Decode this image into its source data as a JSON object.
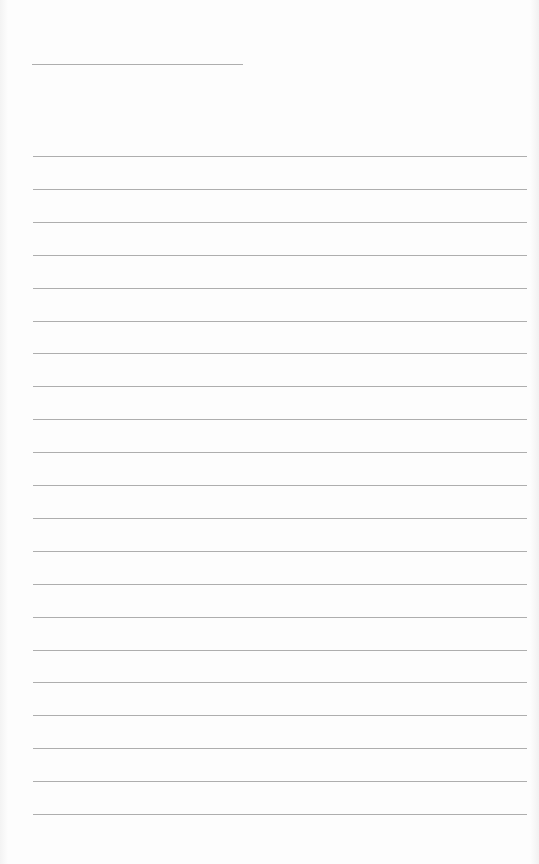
{
  "paper": {
    "background": "#fdfdfd",
    "line_color": "#9a9a9a",
    "header_line": {
      "x1": 32,
      "x2": 243,
      "y": 64
    },
    "ruled_lines": {
      "x1": 33,
      "x2": 527,
      "y_start": 156,
      "spacing": 32.9,
      "count": 21
    }
  }
}
